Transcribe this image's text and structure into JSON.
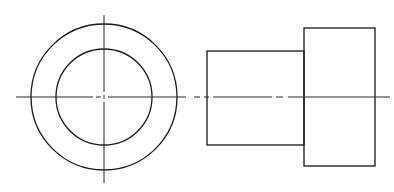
{
  "diagram": {
    "type": "orthographic-projection",
    "stroke_color": "#1a1a1a",
    "background": "#ffffff",
    "front_view": {
      "center": [
        104,
        97
      ],
      "outer_radius": 73,
      "inner_radius": 48,
      "centerline_vertical": {
        "x": 104,
        "y1": 15,
        "y2": 183
      },
      "centerline_horizontal": {
        "y": 97,
        "x1": 16,
        "x2": 200
      }
    },
    "side_view": {
      "small_cylinder": {
        "x": 207,
        "y": 51,
        "width": 97,
        "height": 94
      },
      "large_cylinder": {
        "x": 304,
        "y": 28,
        "width": 71,
        "height": 138
      },
      "centerline": {
        "y": 97,
        "x1": 180,
        "x2": 390
      }
    }
  }
}
